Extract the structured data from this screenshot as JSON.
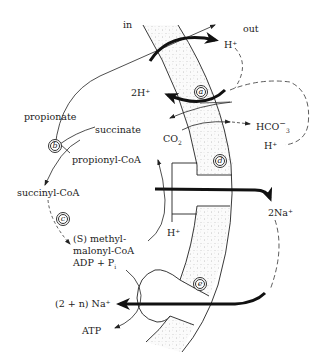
{
  "diagram": {
    "side_labels": {
      "inside": "in",
      "outside": "out"
    },
    "enzymes": {
      "a": "a",
      "b": "b",
      "c": "c",
      "d": "d",
      "e": "e"
    },
    "metabolites": {
      "propionate": "propionate",
      "succinate": "succinate",
      "propionyl_coa": "propionyl-CoA",
      "succinyl_coa": "succinyl-CoA",
      "methylmalonyl_line1": "(S) methyl-",
      "methylmalonyl_line2": "malonyl-CoA",
      "adp_pi": "ADP + P",
      "adp_pi_sub": "i",
      "atp": "ATP",
      "co2": "CO",
      "co2_sub": "2"
    },
    "ions": {
      "h_out": "H⁺",
      "two_h_in": "2H⁺",
      "hco3": "HCO",
      "hco3_sup": "−",
      "hco3_sub": "3",
      "h_out2": "H⁺",
      "h_in_d": "H⁺",
      "two_na_out": "2Na⁺",
      "na_in": "(2 + n) Na⁺"
    },
    "colors": {
      "ink": "#222222",
      "stipple": "#9a9a9a",
      "background": "#ffffff"
    }
  }
}
